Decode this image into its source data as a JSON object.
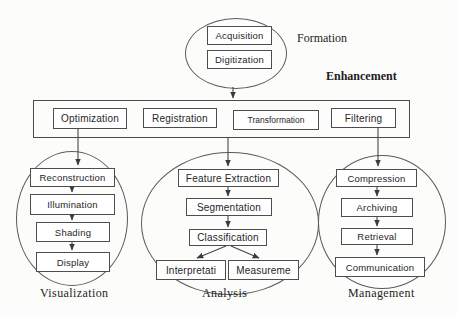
{
  "stages": {
    "formation": {
      "label": "Formation",
      "nodes": [
        "Acquisition",
        "Digitization"
      ]
    },
    "enhancement": {
      "label": "Enhancement",
      "nodes": [
        "Optimization",
        "Registration",
        "Transformation",
        "Filtering"
      ]
    },
    "visualization": {
      "label": "Visualization",
      "nodes": [
        "Reconstruction",
        "Illumination",
        "Shading",
        "Display"
      ]
    },
    "analysis": {
      "label": "Analysis",
      "nodes": [
        "Feature Extraction",
        "Segmentation",
        "Classification"
      ],
      "outputs": [
        "Interpretati",
        "Measureme"
      ]
    },
    "management": {
      "label": "Management",
      "nodes": [
        "Compression",
        "Archiving",
        "Retrieval",
        "Communication"
      ]
    },
    "colors": {
      "line": "#474747",
      "text": "#262626",
      "background": "#fcfcfb"
    }
  }
}
